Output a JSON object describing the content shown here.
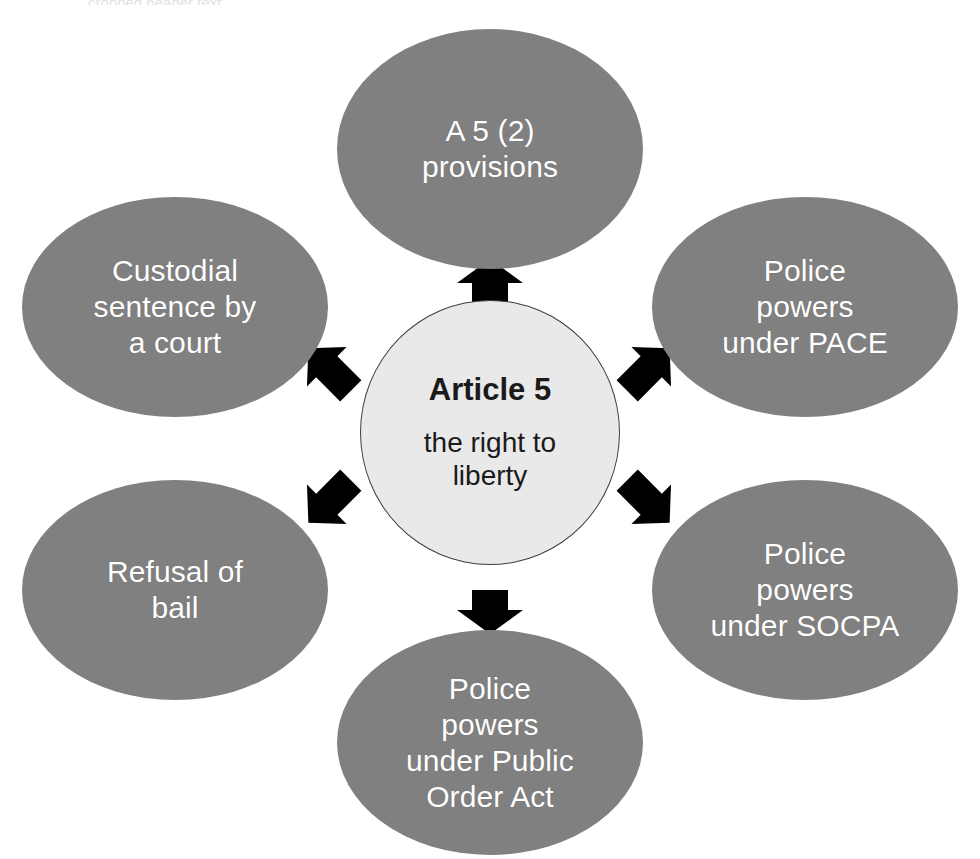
{
  "diagram": {
    "type": "radial-hub-and-spoke",
    "title": "Article 5 the right to liberty",
    "background_color": "#ffffff",
    "node_fill_color": "#808080",
    "node_text_color": "#ffffff",
    "center_fill_color": "#e9e9e9",
    "center_border_color": "#3f3f3f",
    "center_text_color": "#1a1a1a",
    "arrow_color": "#000000",
    "top_remnant_text": "cropped header text"
  },
  "center": {
    "title": "Article 5",
    "subtitle_line1": "the right to",
    "subtitle_line2": "liberty"
  },
  "nodes": [
    {
      "id": "a5-2-provisions",
      "position": "top",
      "lines": [
        "A 5 (2)",
        "provisions"
      ],
      "text": "A 5 (2) provisions"
    },
    {
      "id": "police-powers-pace",
      "position": "top-right",
      "lines": [
        "Police",
        "powers",
        "under PACE"
      ],
      "text": "Police powers under PACE"
    },
    {
      "id": "police-powers-socpa",
      "position": "bottom-right",
      "lines": [
        "Police",
        "powers",
        "under SOCPA"
      ],
      "text": "Police powers under SOCPA"
    },
    {
      "id": "police-powers-public-order-act",
      "position": "bottom",
      "lines": [
        "Police",
        "powers",
        "under Public",
        "Order Act"
      ],
      "text": "Police powers under Public Order Act"
    },
    {
      "id": "refusal-of-bail",
      "position": "bottom-left",
      "lines": [
        "Refusal of",
        "bail"
      ],
      "text": "Refusal of bail"
    },
    {
      "id": "custodial-sentence-by-a-court",
      "position": "top-left",
      "lines": [
        "Custodial",
        "sentence by",
        "a court"
      ],
      "text": "Custodial sentence by a court"
    }
  ],
  "arrows": [
    {
      "id": "arrow-up",
      "direction": "up",
      "from": "center",
      "to": "a5-2-provisions"
    },
    {
      "id": "arrow-up-right",
      "direction": "up-right",
      "from": "center",
      "to": "police-powers-pace"
    },
    {
      "id": "arrow-down-right",
      "direction": "down-right",
      "from": "center",
      "to": "police-powers-socpa"
    },
    {
      "id": "arrow-down",
      "direction": "down",
      "from": "center",
      "to": "police-powers-public-order-act"
    },
    {
      "id": "arrow-down-left",
      "direction": "down-left",
      "from": "center",
      "to": "refusal-of-bail"
    },
    {
      "id": "arrow-up-left",
      "direction": "up-left",
      "from": "center",
      "to": "custodial-sentence-by-a-court"
    }
  ]
}
